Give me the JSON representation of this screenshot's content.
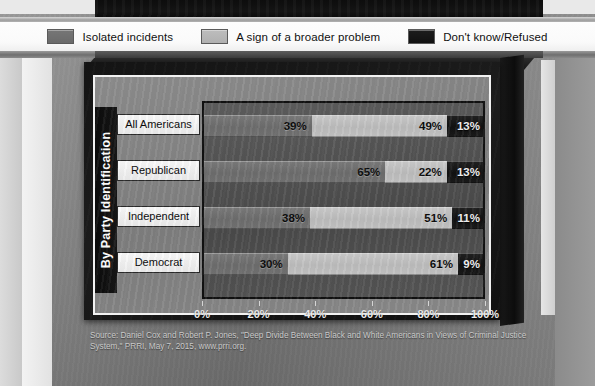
{
  "legend": {
    "items": [
      {
        "label": "Isolated incidents",
        "color": "#6f6f6f",
        "swatch_icon": "legend-swatch-icon"
      },
      {
        "label": "A sign of a broader problem",
        "color": "#bdbdbd",
        "swatch_icon": "legend-swatch-icon"
      },
      {
        "label": "Don't know/Refused",
        "color": "#151515",
        "swatch_icon": "legend-swatch-icon"
      }
    ]
  },
  "axis_title": "By Party Identification",
  "source": "Source: Daniel Cox and Robert P. Jones, \"Deep Divide Between Black and White Americans in Views of Criminal Justice System,\" PRRI, May 7, 2015, www.prri.org.",
  "chart_data": {
    "type": "bar",
    "orientation": "horizontal",
    "stacked": true,
    "title": "",
    "xlabel": "",
    "ylabel": "By Party Identification",
    "xlim": [
      0,
      100
    ],
    "xticks": [
      "0%",
      "20%",
      "40%",
      "60%",
      "80%",
      "100%"
    ],
    "xtick_values": [
      0,
      20,
      40,
      60,
      80,
      100
    ],
    "grid": false,
    "legend_position": "top",
    "categories": [
      "All Americans",
      "Republican",
      "Independent",
      "Democrat"
    ],
    "series": [
      {
        "name": "Isolated incidents",
        "color": "#6f6f6f",
        "values": [
          39,
          65,
          38,
          30
        ],
        "labels": [
          "39%",
          "65%",
          "38%",
          "30%"
        ]
      },
      {
        "name": "A sign of a broader problem",
        "color": "#bdbdbd",
        "values": [
          49,
          22,
          51,
          61
        ],
        "labels": [
          "49%",
          "22%",
          "51%",
          "61%"
        ]
      },
      {
        "name": "Don't know/Refused",
        "color": "#151515",
        "values": [
          13,
          13,
          11,
          9
        ],
        "labels": [
          "13%",
          "13%",
          "11%",
          "9%"
        ]
      }
    ]
  }
}
